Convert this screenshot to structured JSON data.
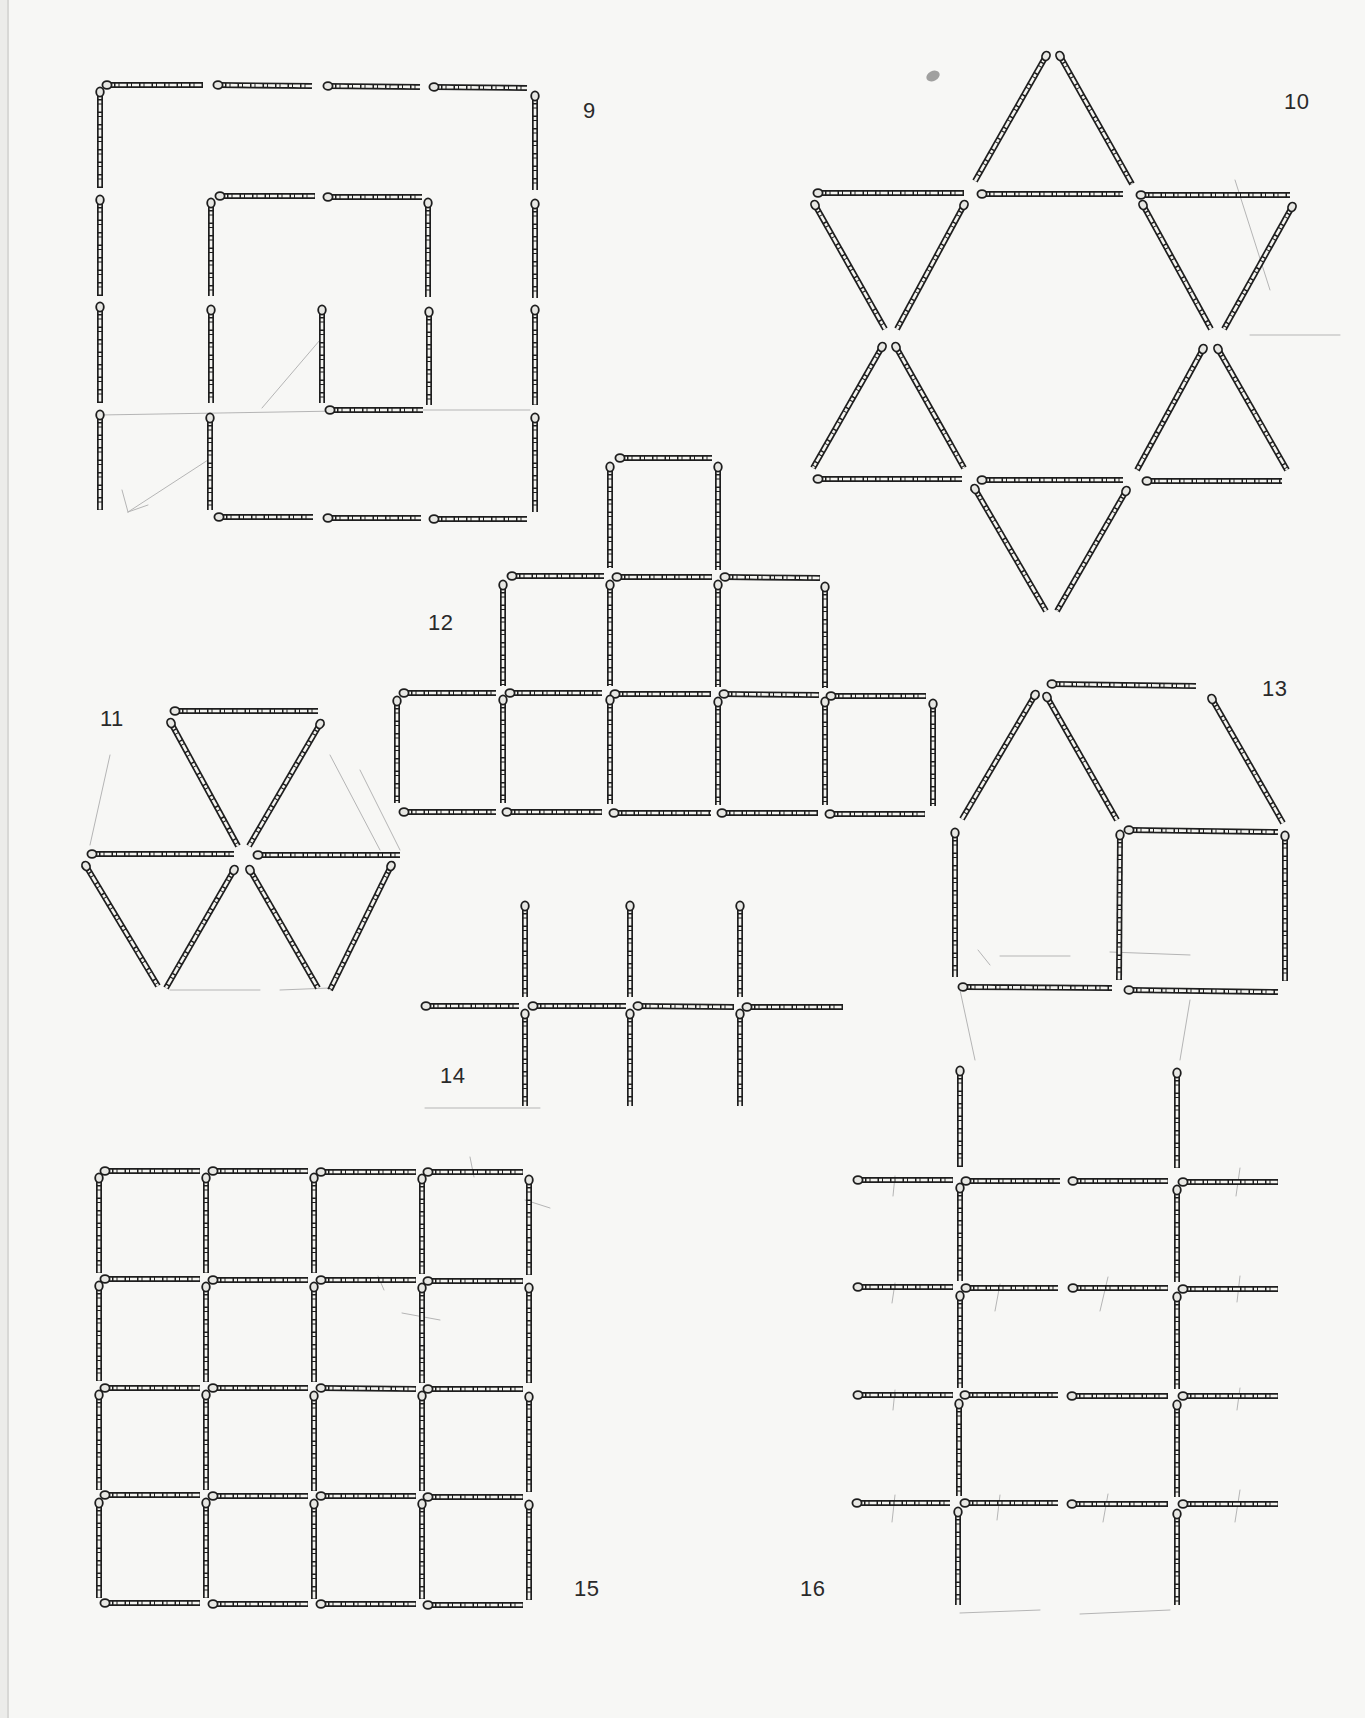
{
  "page": {
    "paper_color": "#f7f7f5",
    "ink_color": "#1e1e1e",
    "match_fill": "#f4f4f0",
    "pencil_color": "#b5b5b5"
  },
  "figures": [
    {
      "id": "9",
      "label": "9",
      "label_pos": [
        583,
        110
      ],
      "shape": "square spiral",
      "matches": [
        [
          107,
          85,
          203,
          85
        ],
        [
          218,
          85,
          312,
          86
        ],
        [
          328,
          86,
          420,
          87
        ],
        [
          434,
          87,
          527,
          88
        ],
        [
          100,
          92,
          100,
          188
        ],
        [
          100,
          200,
          100,
          296
        ],
        [
          100,
          307,
          100,
          403
        ],
        [
          100,
          415,
          100,
          510
        ],
        [
          535,
          96,
          535,
          190
        ],
        [
          535,
          204,
          535,
          298
        ],
        [
          535,
          310,
          535,
          405
        ],
        [
          535,
          418,
          535,
          512
        ],
        [
          211,
          203,
          211,
          296
        ],
        [
          211,
          310,
          211,
          403
        ],
        [
          210,
          418,
          210,
          510
        ],
        [
          220,
          196,
          315,
          196
        ],
        [
          328,
          197,
          422,
          197
        ],
        [
          428,
          203,
          428,
          297
        ],
        [
          429,
          312,
          429,
          405
        ],
        [
          322,
          310,
          322,
          403
        ],
        [
          330,
          410,
          423,
          410
        ],
        [
          219,
          517,
          313,
          517
        ],
        [
          328,
          518,
          421,
          518
        ],
        [
          434,
          519,
          527,
          519
        ]
      ]
    },
    {
      "id": "10",
      "label": "10",
      "label_pos": [
        1284,
        101
      ],
      "shape": "six-pointed star",
      "matches": [
        [
          1046,
          56,
          975,
          181
        ],
        [
          1060,
          56,
          1132,
          184
        ],
        [
          818,
          193,
          964,
          193
        ],
        [
          982,
          194,
          1123,
          194
        ],
        [
          1141,
          195,
          1290,
          195
        ],
        [
          815,
          205,
          885,
          329
        ],
        [
          964,
          205,
          897,
          329
        ],
        [
          1143,
          205,
          1211,
          329
        ],
        [
          1292,
          207,
          1224,
          329
        ],
        [
          882,
          347,
          813,
          468
        ],
        [
          896,
          347,
          964,
          468
        ],
        [
          1203,
          349,
          1137,
          470
        ],
        [
          1218,
          349,
          1287,
          470
        ],
        [
          818,
          479,
          962,
          479
        ],
        [
          982,
          480,
          1123,
          480
        ],
        [
          1147,
          481,
          1282,
          481
        ],
        [
          975,
          489,
          1046,
          611
        ],
        [
          1126,
          491,
          1057,
          611
        ]
      ]
    },
    {
      "id": "11",
      "label": "11",
      "label_pos": [
        100,
        718
      ],
      "shape": "hexagon of triangles",
      "matches": [
        [
          175,
          711,
          318,
          711
        ],
        [
          171,
          723,
          238,
          846
        ],
        [
          320,
          724,
          249,
          846
        ],
        [
          92,
          854,
          234,
          854
        ],
        [
          258,
          855,
          400,
          855
        ],
        [
          86,
          866,
          158,
          986
        ],
        [
          234,
          870,
          166,
          988
        ],
        [
          250,
          870,
          318,
          988
        ],
        [
          391,
          866,
          330,
          990
        ]
      ]
    },
    {
      "id": "12",
      "label": "12",
      "label_pos": [
        428,
        622
      ],
      "shape": "stepped pyramid of squares",
      "matches": [
        [
          620,
          458,
          712,
          458
        ],
        [
          610,
          467,
          610,
          568
        ],
        [
          718,
          467,
          718,
          570
        ],
        [
          512,
          576,
          604,
          576
        ],
        [
          617,
          577,
          712,
          577
        ],
        [
          725,
          577,
          820,
          578
        ],
        [
          503,
          585,
          503,
          686
        ],
        [
          610,
          585,
          610,
          686
        ],
        [
          718,
          585,
          718,
          687
        ],
        [
          825,
          587,
          825,
          688
        ],
        [
          404,
          693,
          496,
          693
        ],
        [
          510,
          693,
          602,
          693
        ],
        [
          615,
          694,
          711,
          694
        ],
        [
          724,
          694,
          819,
          695
        ],
        [
          831,
          696,
          926,
          696
        ],
        [
          397,
          701,
          397,
          803
        ],
        [
          503,
          700,
          503,
          803
        ],
        [
          610,
          700,
          610,
          804
        ],
        [
          718,
          702,
          718,
          805
        ],
        [
          825,
          702,
          825,
          805
        ],
        [
          933,
          704,
          933,
          806
        ],
        [
          404,
          812,
          496,
          812
        ],
        [
          507,
          812,
          602,
          812
        ],
        [
          614,
          813,
          711,
          813
        ],
        [
          722,
          813,
          818,
          813
        ],
        [
          830,
          814,
          925,
          814
        ]
      ]
    },
    {
      "id": "13",
      "label": "13",
      "label_pos": [
        1262,
        688
      ],
      "shape": "house",
      "matches": [
        [
          1052,
          684,
          1196,
          686
        ],
        [
          1035,
          695,
          962,
          819
        ],
        [
          1047,
          697,
          1117,
          820
        ],
        [
          1212,
          699,
          1283,
          823
        ],
        [
          955,
          833,
          955,
          977
        ],
        [
          1120,
          835,
          1119,
          980
        ],
        [
          1285,
          836,
          1285,
          981
        ],
        [
          1129,
          830,
          1278,
          832
        ],
        [
          963,
          987,
          1112,
          988
        ],
        [
          1129,
          990,
          1278,
          992
        ]
      ]
    },
    {
      "id": "14",
      "label": "14",
      "label_pos": [
        440,
        1075
      ],
      "shape": "three crosses",
      "matches": [
        [
          525,
          906,
          525,
          997
        ],
        [
          630,
          906,
          630,
          997
        ],
        [
          740,
          906,
          740,
          997
        ],
        [
          426,
          1006,
          519,
          1006
        ],
        [
          533,
          1006,
          626,
          1006
        ],
        [
          638,
          1006,
          734,
          1007
        ],
        [
          747,
          1007,
          843,
          1007
        ],
        [
          525,
          1014,
          525,
          1106
        ],
        [
          630,
          1014,
          630,
          1106
        ],
        [
          740,
          1014,
          740,
          1106
        ]
      ]
    },
    {
      "id": "15",
      "label": "15",
      "label_pos": [
        574,
        1588
      ],
      "shape": "4x4 grid of squares",
      "matches": [
        [
          105,
          1171,
          200,
          1171
        ],
        [
          213,
          1171,
          308,
          1171
        ],
        [
          321,
          1172,
          416,
          1172
        ],
        [
          428,
          1172,
          523,
          1172
        ],
        [
          99,
          1178,
          99,
          1273
        ],
        [
          206,
          1178,
          206,
          1273
        ],
        [
          314,
          1178,
          314,
          1273
        ],
        [
          422,
          1179,
          422,
          1274
        ],
        [
          529,
          1180,
          529,
          1275
        ],
        [
          105,
          1279,
          200,
          1279
        ],
        [
          213,
          1280,
          308,
          1280
        ],
        [
          321,
          1280,
          416,
          1280
        ],
        [
          428,
          1281,
          523,
          1281
        ],
        [
          99,
          1286,
          99,
          1381
        ],
        [
          206,
          1287,
          206,
          1382
        ],
        [
          314,
          1287,
          314,
          1382
        ],
        [
          422,
          1288,
          422,
          1383
        ],
        [
          529,
          1288,
          529,
          1383
        ],
        [
          105,
          1388,
          200,
          1388
        ],
        [
          213,
          1388,
          308,
          1388
        ],
        [
          321,
          1388,
          416,
          1389
        ],
        [
          428,
          1389,
          523,
          1389
        ],
        [
          99,
          1395,
          99,
          1490
        ],
        [
          206,
          1395,
          206,
          1490
        ],
        [
          314,
          1396,
          314,
          1491
        ],
        [
          422,
          1396,
          422,
          1491
        ],
        [
          529,
          1397,
          529,
          1492
        ],
        [
          105,
          1495,
          200,
          1495
        ],
        [
          213,
          1496,
          308,
          1496
        ],
        [
          321,
          1496,
          416,
          1496
        ],
        [
          428,
          1497,
          523,
          1497
        ],
        [
          99,
          1503,
          99,
          1598
        ],
        [
          206,
          1503,
          206,
          1598
        ],
        [
          314,
          1504,
          314,
          1599
        ],
        [
          422,
          1504,
          422,
          1599
        ],
        [
          529,
          1505,
          529,
          1600
        ],
        [
          105,
          1603,
          200,
          1603
        ],
        [
          213,
          1604,
          308,
          1604
        ],
        [
          321,
          1604,
          416,
          1604
        ],
        [
          428,
          1605,
          523,
          1605
        ]
      ]
    },
    {
      "id": "16",
      "label": "16",
      "label_pos": [
        800,
        1588
      ],
      "shape": "ladder grid",
      "matches": [
        [
          960,
          1071,
          960,
          1167
        ],
        [
          1177,
          1073,
          1177,
          1168
        ],
        [
          858,
          1180,
          953,
          1180
        ],
        [
          966,
          1181,
          1060,
          1181
        ],
        [
          1073,
          1181,
          1168,
          1181
        ],
        [
          1183,
          1182,
          1278,
          1182
        ],
        [
          960,
          1188,
          960,
          1281
        ],
        [
          1177,
          1190,
          1177,
          1282
        ],
        [
          858,
          1287,
          953,
          1287
        ],
        [
          966,
          1288,
          1058,
          1288
        ],
        [
          1073,
          1288,
          1168,
          1288
        ],
        [
          1183,
          1289,
          1278,
          1289
        ],
        [
          960,
          1296,
          960,
          1388
        ],
        [
          1177,
          1297,
          1177,
          1389
        ],
        [
          858,
          1395,
          953,
          1395
        ],
        [
          965,
          1395,
          1058,
          1395
        ],
        [
          1072,
          1396,
          1168,
          1396
        ],
        [
          1183,
          1396,
          1278,
          1396
        ],
        [
          959,
          1404,
          959,
          1496
        ],
        [
          1177,
          1405,
          1177,
          1497
        ],
        [
          857,
          1503,
          950,
          1503
        ],
        [
          965,
          1503,
          1058,
          1503
        ],
        [
          1072,
          1504,
          1168,
          1504
        ],
        [
          1183,
          1504,
          1278,
          1504
        ],
        [
          958,
          1512,
          958,
          1605
        ],
        [
          1177,
          1514,
          1177,
          1605
        ]
      ]
    }
  ],
  "pencil_marks": [
    [
      100,
      415,
      400,
      410
    ],
    [
      410,
      410,
      530,
      410
    ],
    [
      320,
      340,
      262,
      408
    ],
    [
      208,
      460,
      128,
      512
    ],
    [
      128,
      512,
      148,
      505
    ],
    [
      128,
      512,
      122,
      490
    ],
    [
      1235,
      180,
      1270,
      290
    ],
    [
      1250,
      335,
      1340,
      335
    ],
    [
      110,
      755,
      90,
      845
    ],
    [
      330,
      755,
      380,
      850
    ],
    [
      360,
      770,
      400,
      850
    ],
    [
      170,
      990,
      260,
      990
    ],
    [
      280,
      990,
      330,
      988
    ],
    [
      978,
      950,
      990,
      965
    ],
    [
      1000,
      956,
      1070,
      956
    ],
    [
      1110,
      952,
      1190,
      955
    ],
    [
      960,
      990,
      975,
      1060
    ],
    [
      1190,
      1000,
      1180,
      1060
    ],
    [
      895,
      1176,
      893,
      1196
    ],
    [
      1240,
      1168,
      1236,
      1196
    ],
    [
      895,
      1283,
      892,
      1303
    ],
    [
      1000,
      1284,
      995,
      1311
    ],
    [
      1108,
      1277,
      1100,
      1311
    ],
    [
      1240,
      1276,
      1237,
      1302
    ],
    [
      895,
      1390,
      893,
      1410
    ],
    [
      1240,
      1388,
      1237,
      1410
    ],
    [
      895,
      1495,
      892,
      1522
    ],
    [
      1000,
      1495,
      997,
      1520
    ],
    [
      1108,
      1494,
      1103,
      1522
    ],
    [
      1240,
      1490,
      1235,
      1522
    ],
    [
      960,
      1613,
      1040,
      1610
    ],
    [
      1080,
      1614,
      1170,
      1610
    ],
    [
      425,
      1108,
      540,
      1108
    ],
    [
      470,
      1157,
      474,
      1177
    ],
    [
      525,
      1200,
      550,
      1208
    ],
    [
      378,
      1276,
      384,
      1290
    ],
    [
      402,
      1313,
      440,
      1320
    ]
  ],
  "smudges": [
    [
      933,
      76
    ]
  ]
}
